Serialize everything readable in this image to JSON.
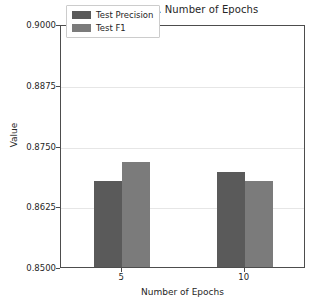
{
  "chart_data": {
    "type": "bar",
    "title": "Metrics vs. Number of Epochs",
    "xlabel": "Number of Epochs",
    "ylabel": "Value",
    "categories": [
      "5",
      "10"
    ],
    "series": [
      {
        "name": "Test Precision",
        "values": [
          0.8677,
          0.8695
        ],
        "color": "#5a5a5a"
      },
      {
        "name": "Test F1",
        "values": [
          0.8716,
          0.8677
        ],
        "color": "#7b7b7b"
      }
    ],
    "ylim": [
      0.85,
      0.9
    ],
    "yticks": [
      0.85,
      0.8625,
      0.875,
      0.8875,
      0.9
    ],
    "ytick_labels": [
      "0.8500",
      "0.8625",
      "0.8750",
      "0.8875",
      "0.9000"
    ],
    "grid": true,
    "legend_position": "upper center"
  }
}
